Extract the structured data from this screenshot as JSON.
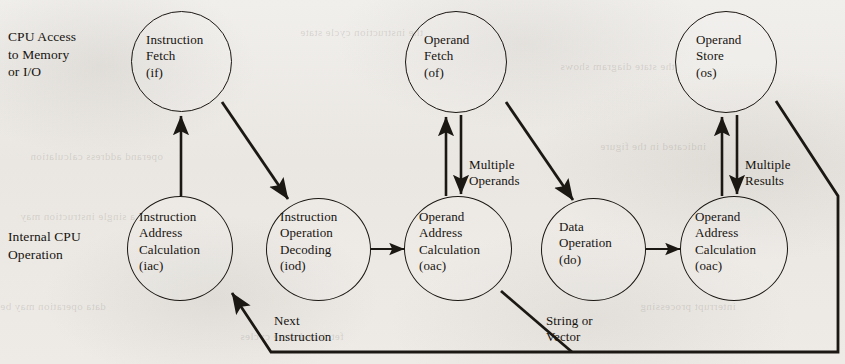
{
  "figure": {
    "ink_color": "#1b1713",
    "paper_color": "#eceae6"
  },
  "row_labels": [
    {
      "id": "cpu-access",
      "lines": [
        "CPU Access",
        "to Memory",
        "or I/O"
      ]
    },
    {
      "id": "internal-cpu",
      "lines": [
        "Internal CPU",
        "Operation"
      ]
    }
  ],
  "nodes": [
    {
      "id": "if",
      "lines": [
        "Instruction",
        "Fetch",
        "(if)"
      ]
    },
    {
      "id": "of",
      "lines": [
        "Operand",
        "Fetch",
        "(of)"
      ]
    },
    {
      "id": "os",
      "lines": [
        "Operand",
        "Store",
        "(os)"
      ]
    },
    {
      "id": "iac",
      "lines": [
        "Instruction",
        "Address",
        "Calculation",
        "(iac)"
      ]
    },
    {
      "id": "iod",
      "lines": [
        "Instruction",
        "Operation",
        "Decoding",
        "(iod)"
      ]
    },
    {
      "id": "oac1",
      "lines": [
        "Operand",
        "Address",
        "Calculation",
        "(oac)"
      ]
    },
    {
      "id": "do",
      "lines": [
        "Data",
        "Operation",
        "(do)"
      ]
    },
    {
      "id": "oac2",
      "lines": [
        "Operand",
        "Address",
        "Calculation",
        "(oac)"
      ]
    }
  ],
  "edge_labels": [
    {
      "id": "multiple-operands",
      "lines": [
        "Multiple",
        "Operands"
      ]
    },
    {
      "id": "multiple-results",
      "lines": [
        "Multiple",
        "Results"
      ]
    },
    {
      "id": "next-instruction",
      "lines": [
        "Next",
        "Instruction"
      ]
    },
    {
      "id": "string-or-vector",
      "lines": [
        "String or",
        "Vector"
      ]
    }
  ],
  "ghost_text": [
    {
      "id": "g1",
      "text": "the instruction cycle state"
    },
    {
      "id": "g2",
      "text": "operand address calculation"
    },
    {
      "id": "g3",
      "text": "indicated in the figure"
    },
    {
      "id": "g4",
      "text": "a single instruction may"
    },
    {
      "id": "g5",
      "text": "data operation may be"
    },
    {
      "id": "g6",
      "text": "interrupt processing"
    },
    {
      "id": "g7",
      "text": "the state diagram shows"
    },
    {
      "id": "g8",
      "text": "fetch and store cycles"
    }
  ]
}
